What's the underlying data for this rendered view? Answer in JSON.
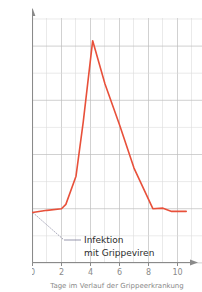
{
  "chart_data": {
    "type": "line",
    "title": "",
    "xlabel": "Tage im Verlauf der Grippeerkrankung",
    "ylabel": "Körpertemperatur in Grad Celsius",
    "xlim": [
      0,
      10.6
    ],
    "ylim": [
      36,
      40.5
    ],
    "xticks": [
      "0",
      "2",
      "4",
      "6",
      "8",
      "10"
    ],
    "xtick_values": [
      0,
      2,
      4,
      6,
      8,
      10
    ],
    "yticks": [
      "36",
      "37",
      "38",
      "39",
      "40"
    ],
    "ytick_values": [
      36,
      37,
      38,
      39,
      40
    ],
    "grid": "major and minor, minor at 0.5 degree and 1 day",
    "legend": "none",
    "series": [
      {
        "name": "Körpertemperatur",
        "color": "#e8503a",
        "x": [
          0,
          1,
          2,
          2.3,
          3,
          3.5,
          4.15,
          5,
          6,
          7,
          8.3,
          9,
          9.6,
          10.6
        ],
        "y": [
          36.93,
          36.97,
          37.0,
          37.08,
          37.6,
          38.6,
          40.1,
          39.3,
          38.55,
          37.75,
          37.0,
          37.01,
          36.95,
          36.95
        ]
      }
    ],
    "annotations": [
      {
        "name": "infektion-annotation",
        "line1": "Infektion",
        "line2": "mit Grippeviren",
        "leader_from": [
          0,
          36.93
        ],
        "leader_to": [
          2.2,
          36.42
        ]
      }
    ],
    "colors": {
      "line": "#e8503a",
      "grid_major": "#b8b8b8",
      "grid_minor": "#d8d8d8",
      "axis": "#8a8a8a",
      "text": "#8a8a8a",
      "annotation_text": "#2b2b2b",
      "background": "#ffffff"
    }
  }
}
